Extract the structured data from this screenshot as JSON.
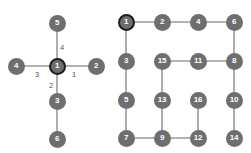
{
  "canvas": {
    "width": 251,
    "height": 153,
    "background": "#ffffff"
  },
  "style": {
    "node_fill": "#6e6e6e",
    "node_text": "#ffffff",
    "root_ring": "#1d1d1d",
    "edge_color": "#9a9a9a",
    "label_color": "#555555",
    "node_diameter": 17
  },
  "diagrams": [
    {
      "id": "star-graph",
      "name": "Left star graph with numbered edges",
      "nodes": [
        {
          "id": "L1",
          "label": "1",
          "x": 57,
          "y": 66,
          "root": true
        },
        {
          "id": "L2",
          "label": "2",
          "x": 96,
          "y": 66,
          "root": false
        },
        {
          "id": "L3",
          "label": "3",
          "x": 57,
          "y": 101,
          "root": false
        },
        {
          "id": "L4",
          "label": "4",
          "x": 16,
          "y": 66,
          "root": false
        },
        {
          "id": "L5",
          "label": "5",
          "x": 57,
          "y": 23,
          "root": false
        },
        {
          "id": "L6",
          "label": "6",
          "x": 57,
          "y": 139,
          "root": false
        }
      ],
      "edges": [
        {
          "from": "L1",
          "to": "L2"
        },
        {
          "from": "L1",
          "to": "L3"
        },
        {
          "from": "L1",
          "to": "L4"
        },
        {
          "from": "L1",
          "to": "L5"
        },
        {
          "from": "L3",
          "to": "L6"
        }
      ],
      "edge_labels": [
        {
          "id": "lbl-right",
          "text": "1",
          "x": 72,
          "y": 71
        },
        {
          "id": "lbl-down",
          "text": "2",
          "x": 49,
          "y": 82
        },
        {
          "id": "lbl-left",
          "text": "3",
          "x": 35,
          "y": 71
        },
        {
          "id": "lbl-up",
          "text": "4",
          "x": 60,
          "y": 44
        }
      ]
    },
    {
      "id": "grid-graph",
      "name": "Right four by four grid traversal tree",
      "nodes": [
        {
          "id": "G1",
          "label": "1",
          "x": 126,
          "y": 22,
          "root": true
        },
        {
          "id": "G2",
          "label": "2",
          "x": 162,
          "y": 22,
          "root": false
        },
        {
          "id": "G4",
          "label": "4",
          "x": 198,
          "y": 22,
          "root": false
        },
        {
          "id": "G6",
          "label": "6",
          "x": 234,
          "y": 22,
          "root": false
        },
        {
          "id": "G3",
          "label": "3",
          "x": 126,
          "y": 61,
          "root": false
        },
        {
          "id": "G15",
          "label": "15",
          "x": 162,
          "y": 61,
          "root": false
        },
        {
          "id": "G11",
          "label": "11",
          "x": 198,
          "y": 61,
          "root": false
        },
        {
          "id": "G8",
          "label": "8",
          "x": 234,
          "y": 61,
          "root": false
        },
        {
          "id": "G5",
          "label": "5",
          "x": 126,
          "y": 100,
          "root": false
        },
        {
          "id": "G13",
          "label": "13",
          "x": 162,
          "y": 100,
          "root": false
        },
        {
          "id": "G16",
          "label": "16",
          "x": 198,
          "y": 100,
          "root": false
        },
        {
          "id": "G10",
          "label": "10",
          "x": 234,
          "y": 100,
          "root": false
        },
        {
          "id": "G7",
          "label": "7",
          "x": 126,
          "y": 138,
          "root": false
        },
        {
          "id": "G9",
          "label": "9",
          "x": 162,
          "y": 138,
          "root": false
        },
        {
          "id": "G12",
          "label": "12",
          "x": 198,
          "y": 138,
          "root": false
        },
        {
          "id": "G14",
          "label": "14",
          "x": 234,
          "y": 138,
          "root": false
        }
      ],
      "edges": [
        {
          "from": "G1",
          "to": "G2"
        },
        {
          "from": "G2",
          "to": "G4"
        },
        {
          "from": "G4",
          "to": "G6"
        },
        {
          "from": "G1",
          "to": "G3"
        },
        {
          "from": "G3",
          "to": "G5"
        },
        {
          "from": "G5",
          "to": "G7"
        },
        {
          "from": "G6",
          "to": "G8"
        },
        {
          "from": "G8",
          "to": "G11"
        },
        {
          "from": "G11",
          "to": "G15"
        },
        {
          "from": "G8",
          "to": "G10"
        },
        {
          "from": "G10",
          "to": "G14"
        },
        {
          "from": "G15",
          "to": "G13"
        },
        {
          "from": "G13",
          "to": "G9"
        },
        {
          "from": "G7",
          "to": "G9"
        },
        {
          "from": "G9",
          "to": "G12"
        },
        {
          "from": "G12",
          "to": "G16"
        }
      ],
      "edge_labels": []
    }
  ]
}
